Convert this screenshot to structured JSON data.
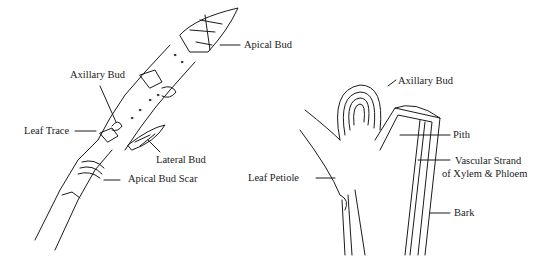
{
  "left_figure": {
    "title": "External twig",
    "labels": {
      "apical_bud": "Apical Bud",
      "axillary_bud": "Axillary Bud",
      "leaf_trace": "Leaf Trace",
      "lateral_bud": "Lateral Bud",
      "apical_bud_scar": "Apical Bud Scar"
    }
  },
  "right_figure": {
    "title": "Longitudinal section",
    "labels": {
      "axillary_bud": "Axillary Bud",
      "pith": "Pith",
      "vascular_strand_line1": "Vascular Strand",
      "vascular_strand_line2": "of Xylem & Phloem",
      "leaf_petiole": "Leaf Petiole",
      "bark": "Bark"
    }
  },
  "colors": {
    "ink": "#1a1a1a",
    "background": "#ffffff",
    "shade": "#d8d8d8"
  }
}
